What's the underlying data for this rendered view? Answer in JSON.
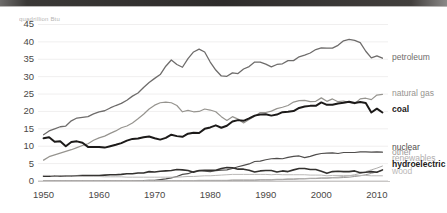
{
  "window": {
    "titlebar_present": true
  },
  "chart_data": {
    "type": "line",
    "title": "quadrillion Btu",
    "title_clipped": true,
    "xlabel": "",
    "ylabel": "",
    "xlim": [
      1949,
      2012
    ],
    "ylim": [
      0,
      46
    ],
    "yticks": [
      0,
      5,
      10,
      15,
      20,
      25,
      30,
      35,
      40,
      45
    ],
    "ytick_labels": [
      "0",
      "5",
      "10",
      "15",
      "20",
      "25",
      "30",
      "35",
      "40",
      "45"
    ],
    "xticks": [
      1950,
      1960,
      1970,
      1980,
      1990,
      2000,
      2010
    ],
    "xtick_labels": [
      "1950",
      "1960",
      "1970",
      "1980",
      "1990",
      "2000",
      "2010"
    ],
    "grid": "horizontal",
    "legend_position": "right-inline",
    "x": [
      1950,
      1951,
      1952,
      1953,
      1954,
      1955,
      1956,
      1957,
      1958,
      1959,
      1960,
      1961,
      1962,
      1963,
      1964,
      1965,
      1966,
      1967,
      1968,
      1969,
      1970,
      1971,
      1972,
      1973,
      1974,
      1975,
      1976,
      1977,
      1978,
      1979,
      1980,
      1981,
      1982,
      1983,
      1984,
      1985,
      1986,
      1987,
      1988,
      1989,
      1990,
      1991,
      1992,
      1993,
      1994,
      1995,
      1996,
      1997,
      1998,
      1999,
      2000,
      2001,
      2002,
      2003,
      2004,
      2005,
      2006,
      2007,
      2008,
      2009,
      2010,
      2011
    ],
    "series": [
      {
        "name": "petroleum",
        "label": "petroleum",
        "color": "#6e6c6b",
        "width": 1.3,
        "bold": false,
        "label_y_value": 35.3,
        "values": [
          13.3,
          14.4,
          15.0,
          15.6,
          15.8,
          17.3,
          18.1,
          18.3,
          18.5,
          19.3,
          19.9,
          20.2,
          21.0,
          21.7,
          22.3,
          23.2,
          24.4,
          25.3,
          26.9,
          28.3,
          29.5,
          30.6,
          33.0,
          34.8,
          33.5,
          32.7,
          35.2,
          37.1,
          37.9,
          37.1,
          34.2,
          31.9,
          30.2,
          30.1,
          31.1,
          30.9,
          32.2,
          32.9,
          34.2,
          34.2,
          33.6,
          32.8,
          33.5,
          33.7,
          34.6,
          34.6,
          35.7,
          36.2,
          36.8,
          37.8,
          38.3,
          38.2,
          38.2,
          39.0,
          40.3,
          40.7,
          40.4,
          39.8,
          37.3,
          35.4,
          36.0,
          35.3
        ]
      },
      {
        "name": "natural-gas",
        "label": "natural gas",
        "color": "#96948f",
        "width": 1.2,
        "bold": false,
        "label_y_value": 25.0,
        "values": [
          6.0,
          7.0,
          7.5,
          8.0,
          8.5,
          9.0,
          9.6,
          10.2,
          10.7,
          11.7,
          12.4,
          12.9,
          13.7,
          14.4,
          15.3,
          15.8,
          16.7,
          17.9,
          19.2,
          20.7,
          21.8,
          22.5,
          22.7,
          22.5,
          21.7,
          19.9,
          20.3,
          19.9,
          20.0,
          20.7,
          20.4,
          19.9,
          18.5,
          17.4,
          18.5,
          17.8,
          16.7,
          17.7,
          18.6,
          19.7,
          19.7,
          20.1,
          20.8,
          21.2,
          21.7,
          22.7,
          23.1,
          23.2,
          22.8,
          22.9,
          23.9,
          22.9,
          23.6,
          22.8,
          23.0,
          22.6,
          22.2,
          23.6,
          23.8,
          23.4,
          24.7,
          24.9
        ]
      },
      {
        "name": "coal",
        "label": "coal",
        "color": "#1c1a19",
        "width": 2.0,
        "bold": true,
        "label_y_value": 20.4,
        "values": [
          12.3,
          12.6,
          11.3,
          11.4,
          10.0,
          11.2,
          11.4,
          11.0,
          9.8,
          9.8,
          9.8,
          9.6,
          10.0,
          10.4,
          10.9,
          11.6,
          12.1,
          12.2,
          12.6,
          12.8,
          12.3,
          11.9,
          12.4,
          13.3,
          12.9,
          12.7,
          13.6,
          13.9,
          13.8,
          15.0,
          15.4,
          16.0,
          15.3,
          15.9,
          17.1,
          17.5,
          17.3,
          18.0,
          18.8,
          19.1,
          19.2,
          18.8,
          19.1,
          19.8,
          19.9,
          20.1,
          21.0,
          21.4,
          21.6,
          21.6,
          22.6,
          21.9,
          21.9,
          22.3,
          22.5,
          22.8,
          22.4,
          22.7,
          22.4,
          19.7,
          20.8,
          19.7
        ]
      },
      {
        "name": "nuclear",
        "label": "nuclear",
        "color": "#4f4d4c",
        "width": 1.2,
        "bold": false,
        "label_y_value": 9.6,
        "values": [
          0.0,
          0.0,
          0.0,
          0.0,
          0.0,
          0.0,
          0.0,
          0.0,
          0.0,
          0.0,
          0.0,
          0.0,
          0.0,
          0.0,
          0.0,
          0.0,
          0.0,
          0.1,
          0.1,
          0.2,
          0.2,
          0.4,
          0.6,
          0.9,
          1.3,
          1.9,
          2.1,
          2.7,
          3.0,
          2.8,
          2.7,
          3.0,
          3.1,
          3.2,
          3.6,
          4.1,
          4.5,
          4.9,
          5.6,
          5.7,
          6.1,
          6.4,
          6.5,
          6.4,
          6.8,
          7.1,
          7.2,
          6.7,
          7.1,
          7.6,
          7.9,
          8.0,
          8.1,
          7.9,
          8.2,
          8.2,
          8.2,
          8.4,
          8.4,
          8.3,
          8.4,
          8.3
        ]
      },
      {
        "name": "other",
        "label": "other",
        "color": "#9a9897",
        "width": 1.0,
        "bold": false,
        "label_y_value": 8.0,
        "values": [
          0.0,
          0.0,
          0.0,
          0.0,
          0.0,
          0.0,
          0.0,
          0.0,
          0.0,
          0.0,
          0.0,
          0.0,
          0.0,
          0.0,
          0.0,
          0.0,
          0.0,
          0.0,
          0.0,
          0.0,
          0.0,
          0.0,
          0.0,
          0.0,
          0.0,
          0.0,
          0.0,
          0.0,
          0.1,
          0.1,
          0.1,
          0.1,
          0.1,
          0.1,
          0.2,
          0.2,
          0.2,
          0.2,
          0.2,
          0.3,
          0.3,
          0.3,
          0.4,
          0.4,
          0.5,
          0.5,
          0.6,
          0.6,
          0.7,
          0.7,
          0.8,
          0.8,
          0.9,
          0.9,
          1.0,
          1.1,
          1.3,
          1.5,
          1.8,
          2.2,
          2.6,
          3.0
        ]
      },
      {
        "name": "renewables",
        "label": "renewables",
        "color": "#b0aead",
        "width": 1.0,
        "bold": false,
        "label_y_value": 6.3,
        "values": [
          0.1,
          0.1,
          0.1,
          0.1,
          0.1,
          0.1,
          0.1,
          0.1,
          0.1,
          0.1,
          0.1,
          0.1,
          0.1,
          0.1,
          0.1,
          0.1,
          0.1,
          0.1,
          0.1,
          0.1,
          0.1,
          0.1,
          0.1,
          0.1,
          0.1,
          0.1,
          0.1,
          0.1,
          0.2,
          0.2,
          0.2,
          0.2,
          0.2,
          0.2,
          0.3,
          0.3,
          0.3,
          0.3,
          0.3,
          0.4,
          0.4,
          0.4,
          0.5,
          0.5,
          0.6,
          0.6,
          0.7,
          0.7,
          0.8,
          0.8,
          0.9,
          0.9,
          1.0,
          1.1,
          1.3,
          1.5,
          1.8,
          2.2,
          2.7,
          3.2,
          3.7,
          4.3
        ]
      },
      {
        "name": "hydroelectric",
        "label": "hydroelectric",
        "color": "#33312f",
        "width": 1.6,
        "bold": true,
        "label_y_value": 4.6,
        "values": [
          1.4,
          1.4,
          1.5,
          1.4,
          1.4,
          1.4,
          1.5,
          1.6,
          1.6,
          1.6,
          1.6,
          1.7,
          1.8,
          1.8,
          1.9,
          2.1,
          2.1,
          2.3,
          2.3,
          2.7,
          2.6,
          2.8,
          2.9,
          3.0,
          3.3,
          3.2,
          3.0,
          2.5,
          3.0,
          3.1,
          3.1,
          3.1,
          3.6,
          3.9,
          3.8,
          3.4,
          3.4,
          3.1,
          2.6,
          2.9,
          3.0,
          3.0,
          2.6,
          2.9,
          2.7,
          3.2,
          3.6,
          3.6,
          3.3,
          3.3,
          2.8,
          2.2,
          2.7,
          2.8,
          2.7,
          2.7,
          2.9,
          2.4,
          2.5,
          2.7,
          2.5,
          3.2
        ]
      },
      {
        "name": "wood",
        "label": "wood",
        "color": "#bbb9b8",
        "width": 1.0,
        "bold": false,
        "label_y_value": 2.6,
        "values": [
          1.6,
          1.6,
          1.5,
          1.5,
          1.4,
          1.4,
          1.4,
          1.3,
          1.3,
          1.3,
          1.3,
          1.2,
          1.2,
          1.2,
          1.2,
          1.1,
          1.1,
          1.1,
          1.1,
          1.1,
          1.1,
          1.1,
          1.1,
          1.1,
          1.1,
          1.2,
          1.3,
          1.3,
          1.4,
          1.5,
          1.5,
          1.6,
          1.7,
          1.8,
          1.9,
          1.9,
          1.9,
          1.9,
          1.9,
          1.9,
          1.9,
          1.8,
          1.9,
          1.8,
          1.8,
          1.8,
          1.8,
          1.8,
          1.7,
          1.7,
          1.7,
          1.5,
          1.6,
          1.6,
          1.6,
          1.6,
          1.6,
          1.6,
          1.6,
          1.5,
          1.5,
          1.5
        ]
      }
    ]
  }
}
